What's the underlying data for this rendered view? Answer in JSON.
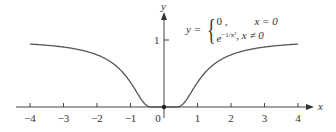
{
  "chart_data": {
    "type": "line",
    "title": "",
    "function": "y = { 0, x = 0 ; e^{-1/x^2}, x ≠ 0 }",
    "xlabel": "x",
    "ylabel": "y",
    "xlim": [
      -4.2,
      4.3
    ],
    "ylim": [
      0,
      1.2
    ],
    "x_ticks": [
      -4,
      -3,
      -2,
      -1,
      0,
      1,
      2,
      3,
      4
    ],
    "y_ticks": [
      1
    ],
    "x_tick_labels": [
      "−4",
      "−3",
      "−2",
      "−1",
      "0",
      "1",
      "2",
      "3",
      "4"
    ],
    "y_tick_labels": [
      "1"
    ],
    "grid": false,
    "series": [
      {
        "name": "e^{-1/x^2}",
        "x": [
          -4,
          -3,
          -2,
          -1.5,
          -1,
          -0.75,
          -0.5,
          -0.3,
          0,
          0.3,
          0.5,
          0.75,
          1,
          1.5,
          2,
          3,
          4
        ],
        "values": [
          0.939,
          0.895,
          0.779,
          0.641,
          0.368,
          0.169,
          0.018,
          0.0,
          0,
          0.0,
          0.018,
          0.169,
          0.368,
          0.641,
          0.779,
          0.895,
          0.939
        ]
      }
    ],
    "annotations": [
      {
        "type": "point",
        "x": 0,
        "y": 0,
        "filled": true
      }
    ]
  },
  "formula": {
    "lhs": "y =",
    "case1_value": "0 ,",
    "case1_cond": "x = 0",
    "case2_value_base": "e",
    "case2_value_exp": "−1/x²",
    "case2_cond": ", x ≠ 0"
  },
  "axes": {
    "x_label": "x",
    "y_label": "y",
    "y_tick_1": "1"
  }
}
